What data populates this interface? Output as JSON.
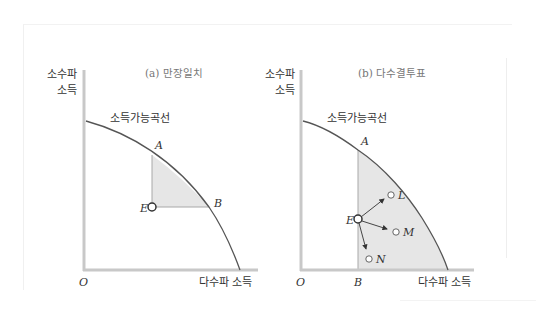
{
  "panels": [
    {
      "id": "a",
      "title": "(a) 만장일치",
      "y_axis_label_line1": "소수파",
      "y_axis_label_line2": "소득",
      "x_axis_label": "다수파 소득",
      "origin_label": "O",
      "curve_label": "소득가능곡선",
      "points": {
        "A": "A",
        "B": "B",
        "E": "E"
      }
    },
    {
      "id": "b",
      "title": "(b) 다수결투표",
      "y_axis_label_line1": "소수파",
      "y_axis_label_line2": "소득",
      "x_axis_label": "다수파 소득",
      "origin_label": "O",
      "curve_label": "소득가능곡선",
      "points": {
        "A": "A",
        "B": "B",
        "E": "E",
        "L": "L",
        "M": "M",
        "N": "N"
      }
    }
  ],
  "colors": {
    "axis": "#c8c8c8",
    "curve": "#555555",
    "shade": "#e6e6e6",
    "shade_edge": "#a8a8a8",
    "text": "#333333"
  }
}
